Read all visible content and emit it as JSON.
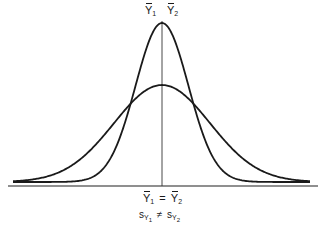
{
  "diagram": {
    "curves": [
      {
        "name": "narrow",
        "relative_sd": 0.55,
        "relative_height": 1.0
      },
      {
        "name": "wide",
        "relative_sd": 1.0,
        "relative_height": 0.61
      }
    ],
    "top_labels": {
      "mean1": {
        "var": "Y",
        "sub": "1"
      },
      "mean2": {
        "var": "Y",
        "sub": "2"
      }
    },
    "bottom_labels": {
      "equation": {
        "left_var": "Y",
        "left_sub": "1",
        "op": "=",
        "right_var": "Y",
        "right_sub": "2"
      },
      "inequality": {
        "left_var": "s",
        "left_sub": "Y",
        "left_subsub": "1",
        "op": "≠",
        "right_var": "s",
        "right_sub": "Y",
        "right_subsub": "2"
      }
    }
  }
}
